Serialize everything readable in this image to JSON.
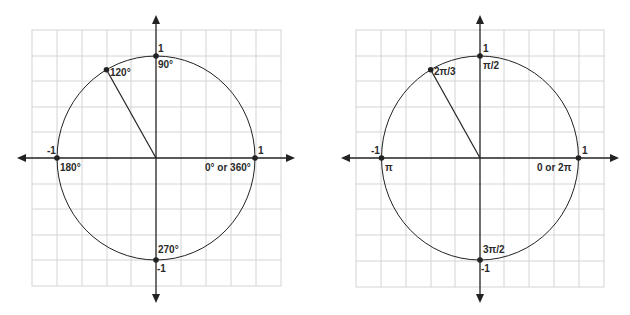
{
  "diagrams": [
    {
      "name": "unit-circle-degrees",
      "grid": {
        "cells_x": 10,
        "cells_y": 10
      },
      "axis_labels": {
        "top": "1",
        "bottom": "-1",
        "left": "-1",
        "right": "1"
      },
      "angle_labels": {
        "q90": "90°",
        "q180": "180°",
        "q270": "270°",
        "q0": "0° or 360°",
        "highlight": "120°"
      },
      "highlight_angle_deg": 120
    },
    {
      "name": "unit-circle-radians",
      "grid": {
        "cells_x": 10,
        "cells_y": 10
      },
      "axis_labels": {
        "top": "1",
        "bottom": "-1",
        "left": "-1",
        "right": "1"
      },
      "angle_labels": {
        "q90": "π/2",
        "q180": "π",
        "q270": "3π/2",
        "q0": "0 or 2π",
        "highlight": "2π/3"
      },
      "highlight_angle_deg": 120
    }
  ],
  "colors": {
    "grid": "#d4d4d4",
    "ink": "#222222",
    "background": "#ffffff"
  }
}
